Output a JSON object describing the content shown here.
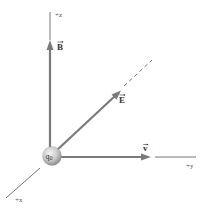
{
  "figure": {
    "type": "3d-coordinate-vector-diagram"
  },
  "axes": {
    "z": {
      "label": "+z"
    },
    "y": {
      "label": "+y"
    },
    "x": {
      "label": "+x"
    }
  },
  "vectors": {
    "B": {
      "label": "B",
      "direction": "+z",
      "arrow": "⃗"
    },
    "E": {
      "label": "E",
      "direction": "diagonal y-z",
      "arrow": "⃗"
    },
    "v": {
      "label": "v",
      "direction": "+y",
      "arrow": "⃗"
    }
  },
  "charge": {
    "label": "q0",
    "symbol": "q",
    "subscript": "0"
  },
  "colors": {
    "axis": "#555555",
    "vector": "#7a7a7a",
    "sphere_light": "#f2f2f2",
    "sphere_dark": "#9a9a9a",
    "text": "#333333"
  }
}
